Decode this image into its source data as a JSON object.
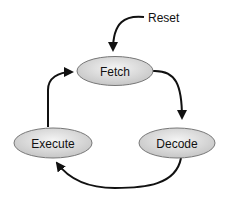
{
  "diagram": {
    "type": "state-cycle",
    "nodes": [
      {
        "id": "fetch",
        "label": "Fetch"
      },
      {
        "id": "decode",
        "label": "Decode"
      },
      {
        "id": "execute",
        "label": "Execute"
      }
    ],
    "external_input": {
      "label": "Reset",
      "target": "fetch"
    },
    "edges": [
      {
        "from": "fetch",
        "to": "decode"
      },
      {
        "from": "decode",
        "to": "execute"
      },
      {
        "from": "execute",
        "to": "fetch"
      }
    ],
    "colors": {
      "node_fill_light": "#f2f2f2",
      "node_fill_dark": "#c8c8c8",
      "stroke": "#111111"
    }
  }
}
